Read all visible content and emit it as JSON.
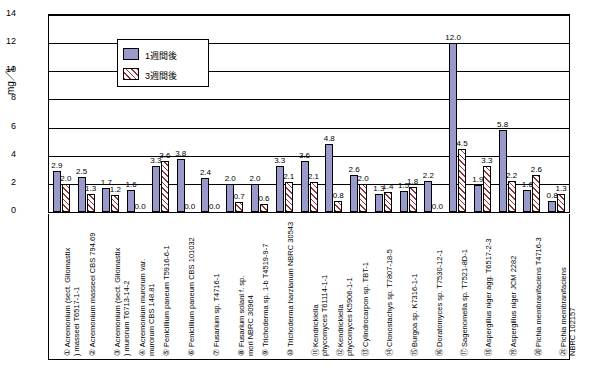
{
  "chart_data": {
    "type": "bar",
    "title": "",
    "xlabel": "",
    "ylabel": "mg／L",
    "ylim": [
      0,
      14
    ],
    "yticks": [
      0,
      2,
      4,
      6,
      8,
      10,
      12,
      14
    ],
    "grid": true,
    "legend_position": "top-left",
    "categories": [
      "① Acremonium (sect. Gliomastix ) masseei T6517-1-1",
      "② Acremonium masseei CBS 794.69",
      "③ Acremonium (sect. Gliomastix ) murorum T6713-14-2",
      "④ Acremonium murorum var. murorum CBS 148.81",
      "⑤ Penicillium paneum T5916-6-1",
      "⑥ Penicillium paneum CBS 101032",
      "⑦ Fusarium sp. T4716-1",
      "⑧ Fusarium solani f. sp. mori NBRC 30964",
      "⑨ Trichoderma sp. 1-b T4519-9-7",
      "⑩ Trichoderma harzianum NBRC 30543",
      "⑪ Kendrickiella phycomyces T61114-1-1",
      "⑫ Kendrickiella phycomyces K5906-1-1",
      "⑬ Cylindrocarpon sp. TBT-1",
      "⑭ Clonostachys sp. T7807-18-5",
      "⑮ Burgoa sp. K7316-1-1",
      "⑯ Doratomyces sp. T7530-12-1",
      "⑰ Sagenomella sp. T7521-8D-1",
      "⑱ Aspergillus niger agg. T6517-2-3",
      "⑲ Aspergillus niger JCM 2282",
      "⑳ Pichia membranifaciens T4716-3",
      "㉑ Pichia membranifaciens NBRC 102157"
    ],
    "series": [
      {
        "name": "1週間後",
        "color": "#9999cc",
        "values": [
          2.9,
          2.5,
          1.7,
          1.6,
          3.3,
          3.8,
          2.4,
          2.0,
          2.0,
          3.3,
          3.6,
          4.8,
          2.6,
          1.3,
          1.5,
          2.2,
          12.0,
          1.9,
          5.8,
          1.6,
          0.8
        ]
      },
      {
        "name": "3週間後",
        "color": "#9b2f37",
        "hatch": true,
        "values": [
          2.0,
          1.3,
          1.2,
          0.0,
          3.6,
          0.0,
          0.0,
          0.7,
          0.6,
          2.1,
          2.1,
          0.8,
          2.0,
          1.4,
          1.8,
          0.0,
          4.5,
          3.3,
          2.2,
          2.6,
          1.3
        ]
      }
    ],
    "bar_labels_series1": [
      "2.9",
      "2.5",
      "1.7",
      "1.6",
      "3.3",
      "3.8",
      "2.4",
      "2.0",
      "2.0",
      "3.3",
      "3.6",
      "4.8",
      "2.6",
      "1.3",
      "1.5",
      "2.2",
      "12.0",
      "1.9",
      "5.8",
      "1.6",
      "0.8"
    ],
    "bar_labels_series2": [
      "2.0",
      "1.3",
      "1.2",
      "0.0",
      "3.6",
      "0.0",
      "0.0",
      "0.7",
      "0.6",
      "2.1",
      "2.1",
      "0.8",
      "2.0",
      "1.4",
      "1.8",
      "0.0",
      "4.5",
      "3.3",
      "2.2",
      "2.6",
      "1.3"
    ]
  }
}
